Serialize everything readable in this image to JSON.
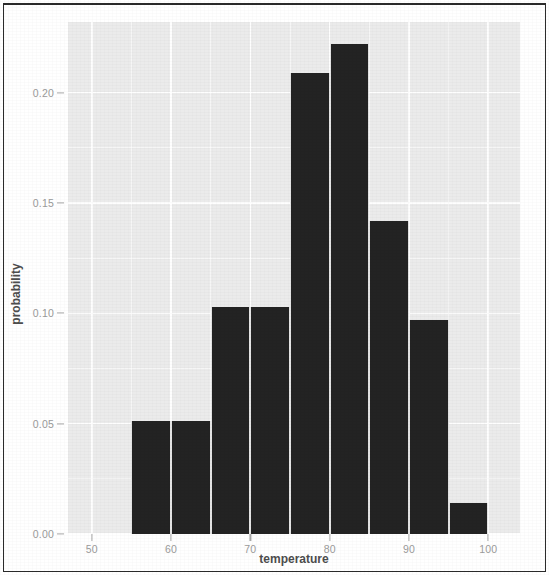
{
  "chart_data": {
    "type": "bar",
    "title": "",
    "subtitle": "",
    "xlabel": "temperature",
    "ylabel": "probability",
    "xlim": [
      47,
      104
    ],
    "ylim": [
      0.0,
      0.232
    ],
    "grid": true,
    "legend": null,
    "bin_width": 5,
    "categories": [
      "55-60",
      "60-65",
      "65-70",
      "70-75",
      "75-80",
      "80-85",
      "85-90",
      "90-95",
      "95-100"
    ],
    "bin_edges": [
      55,
      60,
      65,
      70,
      75,
      80,
      85,
      90,
      95,
      100
    ],
    "values": [
      0.051,
      0.051,
      0.103,
      0.103,
      0.209,
      0.222,
      0.142,
      0.097,
      0.014
    ],
    "x_ticks": [
      50,
      60,
      70,
      80,
      90,
      100
    ],
    "x_tick_labels": [
      "50",
      "60",
      "70",
      "80",
      "90",
      "100"
    ],
    "y_ticks": [
      0.0,
      0.05,
      0.1,
      0.15,
      0.2
    ],
    "y_tick_labels": [
      "0.00",
      "0.05",
      "0.10",
      "0.15",
      "0.20"
    ],
    "y_minor_ticks": [
      0.025,
      0.075,
      0.125,
      0.175
    ],
    "x_minor_ticks": [
      55,
      65,
      75,
      85,
      95
    ],
    "colors": {
      "bar_fill": "#232323",
      "panel_background": "#ebebeb",
      "gridline": "#ffffff",
      "tick_label": "#9a9a9a",
      "axis_title": "#4d4d4d",
      "page_background": "#ffffff",
      "frame": "#2b2b2b"
    }
  }
}
